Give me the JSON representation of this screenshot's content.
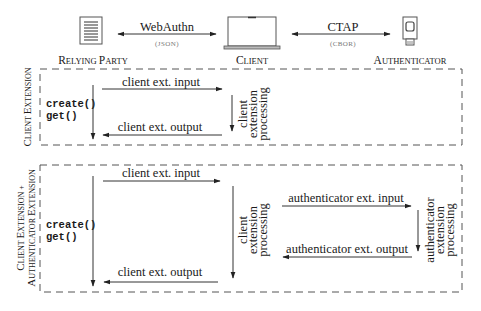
{
  "header": {
    "entities": [
      {
        "name": "Relying Party",
        "label_big": "R",
        "label_rest": "ELYING ",
        "label_big2": "P",
        "label_rest2": "ARTY",
        "icon": "document-icon"
      },
      {
        "name": "Client",
        "label_big": "C",
        "label_rest": "LIENT",
        "icon": "laptop-icon"
      },
      {
        "name": "Authenticator",
        "label_big": "A",
        "label_rest": "UTHENTICATOR",
        "icon": "security-key-icon"
      }
    ],
    "protocols": [
      {
        "name": "WebAuthn",
        "format": "(JSON)"
      },
      {
        "name": "CTAP",
        "format": "(CBOR)"
      }
    ]
  },
  "section1": {
    "side_label_big1": "C",
    "side_label_rest1": "LIENT ",
    "side_label_big2": "E",
    "side_label_rest2": "XTENSION",
    "rp_call_1": "create()",
    "rp_call_2": "get()",
    "input_label": "client ext. input",
    "output_label": "client ext. output",
    "processing": [
      "client",
      "extension",
      "processing"
    ]
  },
  "section2": {
    "side_label_line1_big1": "C",
    "side_label_line1_rest1": "LIENT ",
    "side_label_line1_big2": "E",
    "side_label_line1_rest2": "XTENSION +",
    "side_label_line2_big1": "A",
    "side_label_line2_rest1": "UTHENTICATOR ",
    "side_label_line2_big2": "E",
    "side_label_line2_rest2": "XTENSION",
    "rp_call_1": "create()",
    "rp_call_2": "get()",
    "client_input_label": "client ext. input",
    "client_output_label": "client ext. output",
    "client_processing": [
      "client",
      "extension",
      "processing"
    ],
    "auth_input_label": "authenticator ext. input",
    "auth_output_label": "authenticator ext. output",
    "auth_processing": [
      "authenticator",
      "extension",
      "processing"
    ]
  }
}
